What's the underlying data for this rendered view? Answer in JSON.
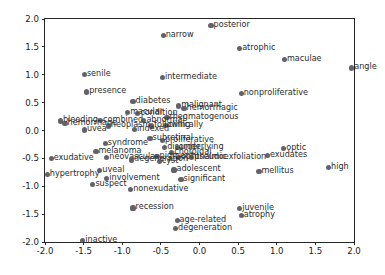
{
  "chart_data": {
    "type": "scatter",
    "title": "",
    "xlabel": "",
    "ylabel": "",
    "xlim": [
      -2.0,
      2.0
    ],
    "ylim": [
      -2.0,
      2.0
    ],
    "grid": false,
    "legend": null,
    "xticks": [
      "-2.0",
      "-1.5",
      "-1.0",
      "-0.5",
      "0.0",
      "0.5",
      "1.0",
      "1.5",
      "2.0"
    ],
    "xtick_values": [
      -2.0,
      -1.5,
      -1.0,
      -0.5,
      0.0,
      0.5,
      1.0,
      1.5,
      2.0
    ],
    "yticks": [
      "-2.0",
      "-1.5",
      "-1.0",
      "-0.5",
      "0.0",
      "0.5",
      "1.0",
      "1.5",
      "2.0"
    ],
    "ytick_values": [
      -2.0,
      -1.5,
      -1.0,
      -0.5,
      0.0,
      0.5,
      1.0,
      1.5,
      2.0
    ],
    "marker_color": "#4c4c55",
    "label_color": "#2b2b2b",
    "points": [
      {
        "label": "posterior",
        "x": 0.15,
        "y": 1.89
      },
      {
        "label": "narrow",
        "x": -0.47,
        "y": 1.7
      },
      {
        "label": "atrophic",
        "x": 0.52,
        "y": 1.47
      },
      {
        "label": "maculae",
        "x": 1.1,
        "y": 1.27
      },
      {
        "label": "angle",
        "x": 1.97,
        "y": 1.12
      },
      {
        "label": "senile",
        "x": -1.49,
        "y": 1.0
      },
      {
        "label": "intermediate",
        "x": -0.48,
        "y": 0.95
      },
      {
        "label": "presence",
        "x": -1.46,
        "y": 0.69
      },
      {
        "label": "nonproliferative",
        "x": 0.54,
        "y": 0.66
      },
      {
        "label": "diabetes",
        "x": -0.86,
        "y": 0.52
      },
      {
        "label": "malignant",
        "x": -0.27,
        "y": 0.44
      },
      {
        "label": "hemorrhagic",
        "x": -0.2,
        "y": 0.4
      },
      {
        "label": "macular",
        "x": -0.93,
        "y": 0.33
      },
      {
        "label": "condition",
        "x": -0.8,
        "y": 0.3
      },
      {
        "label": "rhegmatogenous",
        "x": -0.42,
        "y": 0.24
      },
      {
        "label": "bleeding",
        "x": -1.8,
        "y": 0.17
      },
      {
        "label": "combined",
        "x": -1.28,
        "y": 0.18
      },
      {
        "label": "abnormal",
        "x": -0.72,
        "y": 0.18
      },
      {
        "label": "hemorrhage",
        "x": -1.74,
        "y": 0.12
      },
      {
        "label": "clinically",
        "x": -0.44,
        "y": 0.09
      },
      {
        "label": "following",
        "x": -0.62,
        "y": 0.08
      },
      {
        "label": "neoplasm",
        "x": -1.18,
        "y": 0.08
      },
      {
        "label": "uvea",
        "x": -1.49,
        "y": 0.01
      },
      {
        "label": "indexed",
        "x": -0.84,
        "y": 0.02
      },
      {
        "label": "subretinal",
        "x": -0.64,
        "y": -0.14
      },
      {
        "label": "proliferative",
        "x": -0.48,
        "y": -0.18
      },
      {
        "label": "syndrome",
        "x": -1.22,
        "y": -0.24
      },
      {
        "label": "disorder",
        "x": -0.45,
        "y": -0.31
      },
      {
        "label": "underlying",
        "x": -0.28,
        "y": -0.31
      },
      {
        "label": "melanoma",
        "x": -1.34,
        "y": -0.38
      },
      {
        "label": "choroidal",
        "x": -0.36,
        "y": -0.39
      },
      {
        "label": "optic",
        "x": 1.09,
        "y": -0.33
      },
      {
        "label": "exudative",
        "x": -1.92,
        "y": -0.5
      },
      {
        "label": "neovascular",
        "x": -1.2,
        "y": -0.49
      },
      {
        "label": "pigment",
        "x": -0.55,
        "y": -0.46
      },
      {
        "label": "ophthalmic",
        "x": -0.27,
        "y": -0.48
      },
      {
        "label": "pseudoexfoliation",
        "x": -0.1,
        "y": -0.48
      },
      {
        "label": "exudates",
        "x": 0.88,
        "y": -0.45
      },
      {
        "label": "degeneration",
        "x": -0.88,
        "y": -0.53
      },
      {
        "label": "cyst",
        "x": -0.52,
        "y": -0.56
      },
      {
        "label": "hypertrophy",
        "x": -1.97,
        "y": -0.79
      },
      {
        "label": "uveal",
        "x": -1.29,
        "y": -0.72
      },
      {
        "label": "adolescent",
        "x": -0.33,
        "y": -0.71
      },
      {
        "label": "mellitus",
        "x": 0.77,
        "y": -0.73
      },
      {
        "label": "high",
        "x": 1.67,
        "y": -0.67
      },
      {
        "label": "suspect",
        "x": -1.38,
        "y": -0.97
      },
      {
        "label": "involvement",
        "x": -1.2,
        "y": -0.86
      },
      {
        "label": "significant",
        "x": -0.24,
        "y": -0.88
      },
      {
        "label": "nonexudative",
        "x": -0.89,
        "y": -1.06
      },
      {
        "label": "recession",
        "x": -0.86,
        "y": -1.39
      },
      {
        "label": "juvenile",
        "x": 0.52,
        "y": -1.4
      },
      {
        "label": "atrophy",
        "x": 0.54,
        "y": -1.52
      },
      {
        "label": "age-related",
        "x": -0.29,
        "y": -1.62
      },
      {
        "label": "degeneration",
        "x": -0.31,
        "y": -1.76
      },
      {
        "label": "inactive",
        "x": -1.51,
        "y": -1.98
      }
    ]
  }
}
